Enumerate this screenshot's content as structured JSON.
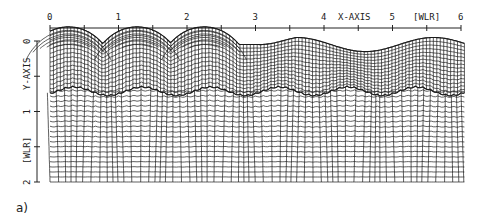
{
  "figure": {
    "caption": "a)",
    "x_axis": {
      "title": "X-AXIS",
      "unit": "[WLR]",
      "ticks": [
        "0",
        "1",
        "2",
        "3",
        "4",
        "5",
        "6"
      ],
      "range": [
        0,
        6
      ]
    },
    "y_axis": {
      "title": "Y-AXIS",
      "unit": "[WLR]",
      "ticks": [
        "0",
        "1",
        "2"
      ],
      "range": [
        0,
        2
      ]
    },
    "mesh": {
      "description": "Deformed computational mesh: fine upper layer with three arched bubbles between x=0 and x=3 and a wavy free surface from x=3 to x=6; a scalloped interface near y=0.7; coarser lower grid down to y=2.",
      "interface_depth": 0.7,
      "bottom_depth": 2
    },
    "colors": {
      "ink": "#1a1a1a",
      "background": "#ffffff"
    }
  }
}
